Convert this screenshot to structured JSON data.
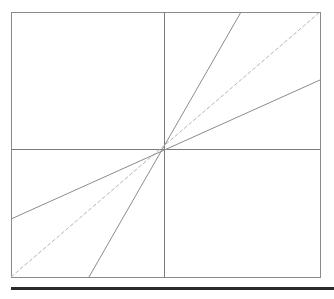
{
  "diagram": {
    "type": "line-through-origin",
    "frame": {
      "x1": 11,
      "y1": 12,
      "x2": 320,
      "y2": 277,
      "color": "#8a8a8a"
    },
    "axes": {
      "vertical": {
        "x": 164,
        "y1": 12,
        "y2": 277,
        "color": "#7a7a7a"
      },
      "horizontal": {
        "y": 149,
        "x1": 11,
        "x2": 320,
        "color": "#7a7a7a"
      }
    },
    "origin": {
      "x": 164,
      "y": 149
    },
    "lines": [
      {
        "name": "steep-line",
        "x1": 89,
        "y1": 277,
        "x2": 241,
        "y2": 12,
        "color": "#8c8c8c",
        "dashed": false
      },
      {
        "name": "diagonal-line",
        "x1": 11,
        "y1": 277,
        "x2": 320,
        "y2": 12,
        "color": "#b5b5b5",
        "dashed": true
      },
      {
        "name": "shallow-line",
        "x1": 11,
        "y1": 219,
        "x2": 320,
        "y2": 80,
        "color": "#8c8c8c",
        "dashed": false
      }
    ],
    "bottom_rule_color": "#2a2a2a"
  }
}
